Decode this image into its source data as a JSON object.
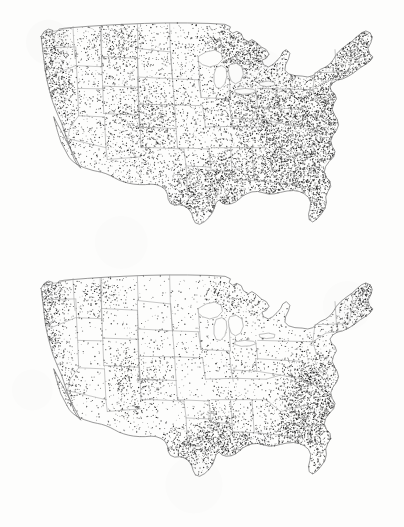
{
  "figure": {
    "kind": "dot-density-map-pair",
    "region": "Contiguous United States",
    "background_color": "#fdfdfc",
    "boundary_color": "#9a9a9a",
    "dot_color": "#1b1b1b",
    "caption_fragment": ""
  },
  "panels": [
    {
      "id": "map-top",
      "name": "upper-us-dot-density-map",
      "label": "",
      "frame": {
        "x": 0,
        "y": 0,
        "width": 404,
        "height": 258
      },
      "map_box": {
        "x": 30,
        "y": 20,
        "width": 358,
        "height": 228
      },
      "dot_count": 10500,
      "dot_radius": 0.45,
      "density_note": "heavy across eastern US, Appalachians, Great Lakes, central Texas; sparse Great Plains and Great Basin"
    },
    {
      "id": "map-bottom",
      "name": "lower-us-dot-density-map",
      "label": "",
      "frame": {
        "x": 0,
        "y": 258,
        "width": 404,
        "height": 269
      },
      "map_box": {
        "x": 30,
        "y": 14,
        "width": 358,
        "height": 228
      },
      "dot_count": 6200,
      "dot_radius": 0.45,
      "density_note": "concentrated in Maine/New England, southeast coastal plain, east Texas, Pacific northwest and California coast"
    }
  ],
  "chart_data": {
    "type": "heatmap",
    "title": "",
    "xlabel": "",
    "ylabel": "",
    "legend": [],
    "maps": [
      {
        "panel": "map-top",
        "description": "Dot density, contiguous US — upper panel",
        "regions": [
          {
            "name": "Pacific Northwest coast",
            "cx": 0.055,
            "cy": 0.09,
            "rx": 0.045,
            "ry": 0.1,
            "density": 0.72
          },
          {
            "name": "Northern California coast",
            "cx": 0.055,
            "cy": 0.3,
            "rx": 0.035,
            "ry": 0.12,
            "density": 0.66
          },
          {
            "name": "Sierra Nevada",
            "cx": 0.095,
            "cy": 0.34,
            "rx": 0.03,
            "ry": 0.13,
            "density": 0.4
          },
          {
            "name": "Southern California",
            "cx": 0.105,
            "cy": 0.52,
            "rx": 0.04,
            "ry": 0.07,
            "density": 0.26
          },
          {
            "name": "Idaho panhandle",
            "cx": 0.215,
            "cy": 0.12,
            "rx": 0.055,
            "ry": 0.09,
            "density": 0.34
          },
          {
            "name": "Western Montana",
            "cx": 0.275,
            "cy": 0.1,
            "rx": 0.05,
            "ry": 0.07,
            "density": 0.3
          },
          {
            "name": "Wasatch / Utah",
            "cx": 0.265,
            "cy": 0.4,
            "rx": 0.04,
            "ry": 0.12,
            "density": 0.33
          },
          {
            "name": "Colorado Rockies",
            "cx": 0.345,
            "cy": 0.44,
            "rx": 0.048,
            "ry": 0.12,
            "density": 0.42
          },
          {
            "name": "Arizona / New Mexico uplands",
            "cx": 0.3,
            "cy": 0.6,
            "rx": 0.065,
            "ry": 0.1,
            "density": 0.24
          },
          {
            "name": "Great Plains",
            "cx": 0.43,
            "cy": 0.38,
            "rx": 0.095,
            "ry": 0.22,
            "density": 0.1
          },
          {
            "name": "Central Texas",
            "cx": 0.44,
            "cy": 0.755,
            "rx": 0.06,
            "ry": 0.085,
            "density": 0.95
          },
          {
            "name": "East Texas / Louisiana",
            "cx": 0.52,
            "cy": 0.78,
            "rx": 0.06,
            "ry": 0.08,
            "density": 0.8
          },
          {
            "name": "Ozarks / Arkansas",
            "cx": 0.54,
            "cy": 0.655,
            "rx": 0.055,
            "ry": 0.075,
            "density": 0.78
          },
          {
            "name": "Minnesota north woods",
            "cx": 0.54,
            "cy": 0.115,
            "rx": 0.05,
            "ry": 0.075,
            "density": 0.62
          },
          {
            "name": "Upper Great Lakes",
            "cx": 0.61,
            "cy": 0.15,
            "rx": 0.06,
            "ry": 0.08,
            "density": 0.7
          },
          {
            "name": "Corn belt (Iowa/Illinois)",
            "cx": 0.59,
            "cy": 0.4,
            "rx": 0.065,
            "ry": 0.115,
            "density": 0.46
          },
          {
            "name": "Ohio valley",
            "cx": 0.69,
            "cy": 0.43,
            "rx": 0.065,
            "ry": 0.11,
            "density": 0.82
          },
          {
            "name": "Appalachians",
            "cx": 0.755,
            "cy": 0.52,
            "rx": 0.06,
            "ry": 0.15,
            "density": 0.9
          },
          {
            "name": "Southeast coastal plain",
            "cx": 0.74,
            "cy": 0.7,
            "rx": 0.09,
            "ry": 0.11,
            "density": 0.84
          },
          {
            "name": "Mid-Atlantic",
            "cx": 0.83,
            "cy": 0.43,
            "rx": 0.06,
            "ry": 0.11,
            "density": 0.86
          },
          {
            "name": "New England",
            "cx": 0.905,
            "cy": 0.235,
            "rx": 0.055,
            "ry": 0.105,
            "density": 0.88
          },
          {
            "name": "Northern Maine",
            "cx": 0.94,
            "cy": 0.105,
            "rx": 0.035,
            "ry": 0.07,
            "density": 0.78
          },
          {
            "name": "Florida peninsula",
            "cx": 0.815,
            "cy": 0.855,
            "rx": 0.03,
            "ry": 0.085,
            "density": 0.36
          }
        ]
      },
      {
        "panel": "map-bottom",
        "description": "Dot density, contiguous US — lower panel",
        "regions": [
          {
            "name": "Puget Sound",
            "cx": 0.06,
            "cy": 0.075,
            "rx": 0.035,
            "ry": 0.06,
            "density": 0.88
          },
          {
            "name": "Oregon coast",
            "cx": 0.048,
            "cy": 0.185,
            "rx": 0.03,
            "ry": 0.075,
            "density": 0.6
          },
          {
            "name": "Northern California coast",
            "cx": 0.05,
            "cy": 0.305,
            "rx": 0.03,
            "ry": 0.09,
            "density": 0.72
          },
          {
            "name": "Central California",
            "cx": 0.085,
            "cy": 0.43,
            "rx": 0.035,
            "ry": 0.1,
            "density": 0.38
          },
          {
            "name": "Southern California",
            "cx": 0.11,
            "cy": 0.545,
            "rx": 0.04,
            "ry": 0.06,
            "density": 0.3
          },
          {
            "name": "Idaho / eastern Washington",
            "cx": 0.195,
            "cy": 0.105,
            "rx": 0.055,
            "ry": 0.08,
            "density": 0.3
          },
          {
            "name": "Wasatch front",
            "cx": 0.265,
            "cy": 0.43,
            "rx": 0.03,
            "ry": 0.095,
            "density": 0.4
          },
          {
            "name": "Colorado front range",
            "cx": 0.34,
            "cy": 0.47,
            "rx": 0.04,
            "ry": 0.09,
            "density": 0.34
          },
          {
            "name": "Arizona highlands",
            "cx": 0.275,
            "cy": 0.59,
            "rx": 0.05,
            "ry": 0.07,
            "density": 0.2
          },
          {
            "name": "Great Plains",
            "cx": 0.44,
            "cy": 0.36,
            "rx": 0.1,
            "ry": 0.23,
            "density": 0.06
          },
          {
            "name": "South Texas",
            "cx": 0.425,
            "cy": 0.79,
            "rx": 0.055,
            "ry": 0.085,
            "density": 0.58
          },
          {
            "name": "East Texas",
            "cx": 0.51,
            "cy": 0.735,
            "rx": 0.055,
            "ry": 0.085,
            "density": 0.76
          },
          {
            "name": "Louisiana / Mississippi delta",
            "cx": 0.59,
            "cy": 0.78,
            "rx": 0.055,
            "ry": 0.07,
            "density": 0.8
          },
          {
            "name": "Ozarks",
            "cx": 0.545,
            "cy": 0.62,
            "rx": 0.045,
            "ry": 0.07,
            "density": 0.34
          },
          {
            "name": "Minnesota north woods",
            "cx": 0.54,
            "cy": 0.11,
            "rx": 0.045,
            "ry": 0.07,
            "density": 0.5
          },
          {
            "name": "Upper Michigan",
            "cx": 0.625,
            "cy": 0.145,
            "rx": 0.045,
            "ry": 0.06,
            "density": 0.36
          },
          {
            "name": "Corn belt",
            "cx": 0.6,
            "cy": 0.4,
            "rx": 0.065,
            "ry": 0.11,
            "density": 0.16
          },
          {
            "name": "Appalachians",
            "cx": 0.755,
            "cy": 0.5,
            "rx": 0.045,
            "ry": 0.13,
            "density": 0.62
          },
          {
            "name": "Southern Appalachian dark core",
            "cx": 0.788,
            "cy": 0.47,
            "rx": 0.022,
            "ry": 0.055,
            "density": 0.95
          },
          {
            "name": "Southeast coastal plain",
            "cx": 0.76,
            "cy": 0.69,
            "rx": 0.085,
            "ry": 0.105,
            "density": 0.84
          },
          {
            "name": "Carolina piedmont",
            "cx": 0.82,
            "cy": 0.59,
            "rx": 0.05,
            "ry": 0.085,
            "density": 0.72
          },
          {
            "name": "Mid-Atlantic",
            "cx": 0.838,
            "cy": 0.43,
            "rx": 0.045,
            "ry": 0.09,
            "density": 0.46
          },
          {
            "name": "Southern New England",
            "cx": 0.9,
            "cy": 0.255,
            "rx": 0.045,
            "ry": 0.075,
            "density": 0.58
          },
          {
            "name": "Maine dark core",
            "cx": 0.935,
            "cy": 0.11,
            "rx": 0.033,
            "ry": 0.075,
            "density": 0.98
          },
          {
            "name": "Florida peninsula",
            "cx": 0.818,
            "cy": 0.855,
            "rx": 0.028,
            "ry": 0.085,
            "density": 0.44
          }
        ]
      }
    ]
  }
}
